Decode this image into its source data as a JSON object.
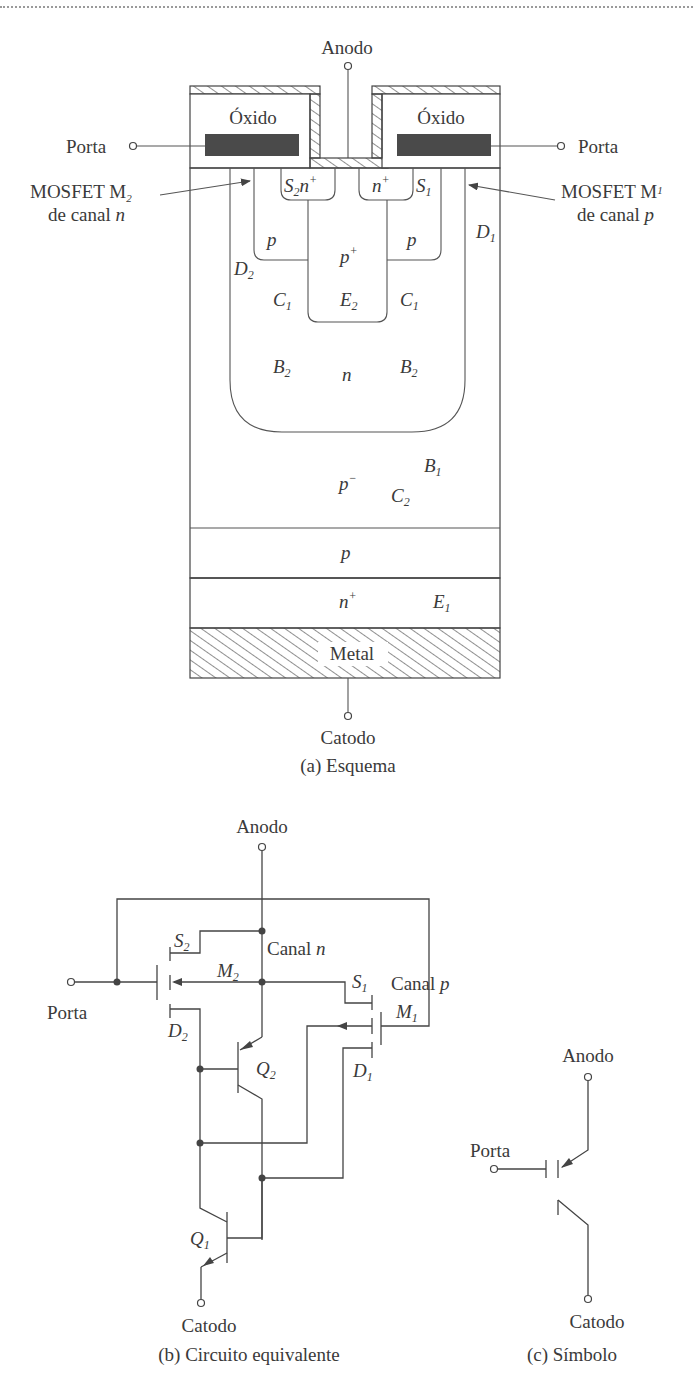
{
  "figure": {
    "schematic": {
      "caption": "(a) Esquema",
      "terminals": {
        "anode": "Anodo",
        "cathode": "Catodo",
        "gate_left": "Porta",
        "gate_right": "Porta"
      },
      "oxide_left": "Óxido",
      "oxide_right": "Óxido",
      "metal": "Metal",
      "annotations": {
        "mosfet_m2_line1": "MOSFET M",
        "mosfet_m2_sub": "2",
        "mosfet_m2_line2": "de canal ",
        "mosfet_m2_channel": "n",
        "mosfet_m1_line1": "MOSFET M",
        "mosfet_m1_sub": "1",
        "mosfet_m1_line2": "de canal ",
        "mosfet_m1_channel": "p"
      },
      "regions": {
        "s2": "S",
        "s2_sub": "2",
        "s2_n": "n",
        "s2_sup": "+",
        "n_plus_right": "n",
        "n_plus_right_sup": "+",
        "s1": "S",
        "s1_sub": "1",
        "p_left": "p",
        "p_right": "p",
        "p_plus": "p",
        "p_plus_sup": "+",
        "d2": "D",
        "d2_sub": "2",
        "d1": "D",
        "d1_sub": "1",
        "c1_left": "C",
        "c1_left_sub": "1",
        "c1_right": "C",
        "c1_right_sub": "1",
        "e2": "E",
        "e2_sub": "2",
        "b2_left": "B",
        "b2_left_sub": "2",
        "b2_right": "B",
        "b2_right_sub": "2",
        "n_well": "n",
        "p_minus": "p",
        "p_minus_sup": "−",
        "b1": "B",
        "b1_sub": "1",
        "c2": "C",
        "c2_sub": "2",
        "p_layer": "p",
        "n_plus_bottom": "n",
        "n_plus_bottom_sup": "+",
        "e1": "E",
        "e1_sub": "1"
      }
    },
    "equivalent_circuit": {
      "caption": "(b) Circuito equivalente",
      "anode": "Anodo",
      "cathode": "Catodo",
      "gate": "Porta",
      "labels": {
        "s2": "S",
        "s2_sub": "2",
        "canal_n": "Canal ",
        "canal_n_i": "n",
        "m2": "M",
        "m2_sub": "2",
        "s1": "S",
        "s1_sub": "1",
        "canal_p": "Canal ",
        "canal_p_i": "p",
        "m1": "M",
        "m1_sub": "1",
        "d2": "D",
        "d2_sub": "2",
        "q2": "Q",
        "q2_sub": "2",
        "d1": "D",
        "d1_sub": "1",
        "q1": "Q",
        "q1_sub": "1"
      }
    },
    "symbol": {
      "caption": "(c) Símbolo",
      "anode": "Anodo",
      "cathode": "Catodo",
      "gate": "Porta"
    }
  },
  "colors": {
    "line": "#444444",
    "gate_fill": "#4a4a4a",
    "text": "#3a3a3a",
    "background": "#ffffff"
  }
}
